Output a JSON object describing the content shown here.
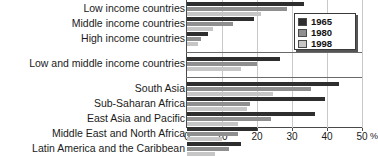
{
  "chart_data": {
    "type": "bar",
    "orientation": "horizontal",
    "title": "",
    "xlabel": "%",
    "ylabel": "",
    "xlim": [
      0,
      50
    ],
    "xticks": [
      0,
      10,
      20,
      30,
      40,
      50
    ],
    "xtick_labels": [
      "0",
      "10",
      "20",
      "30",
      "40",
      "50"
    ],
    "axis_unit_suffix": "%",
    "grid": true,
    "legend_position": "top-right",
    "series": [
      {
        "name": "1965",
        "color": "#2e2e2e"
      },
      {
        "name": "1980",
        "color": "#8f8f8f"
      },
      {
        "name": "1998",
        "color": "#c6c6c6"
      }
    ],
    "panels": [
      {
        "name": "income-groups",
        "categories": [
          "Low income countries",
          "Middle income countries",
          "High income countries"
        ],
        "values": {
          "1965": [
            33.5,
            19.0,
            6.0
          ],
          "1980": [
            28.5,
            13.0,
            4.0
          ],
          "1998": [
            21.0,
            7.5,
            3.0
          ]
        }
      },
      {
        "name": "aggregate",
        "categories": [
          "Low and middle income countries"
        ],
        "values": {
          "1965": [
            26.5
          ],
          "1980": [
            20.0
          ],
          "1998": [
            15.5
          ]
        }
      },
      {
        "name": "regions",
        "categories": [
          "South Asia",
          "Sub-Saharan Africa",
          "East Asia and Pacific",
          "Middle East and North Africa",
          "Latin America and the Caribbean"
        ],
        "values": {
          "1965": [
            43.5,
            39.5,
            36.5,
            20.0,
            15.5
          ],
          "1980": [
            35.5,
            18.0,
            24.0,
            14.5,
            12.0
          ],
          "1998": [
            24.5,
            17.0,
            14.5,
            10.0,
            8.0
          ]
        }
      }
    ]
  },
  "legend": {
    "items": [
      {
        "label": "1965"
      },
      {
        "label": "1980"
      },
      {
        "label": "1998"
      }
    ]
  }
}
